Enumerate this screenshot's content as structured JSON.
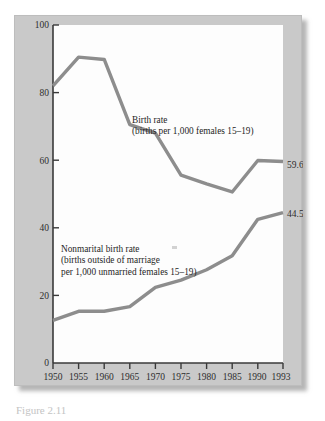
{
  "figure": {
    "caption": "Figure 2.11",
    "panel_color": "#c9c9c9",
    "plot_background": "#fdfdfd",
    "axis_color": "#3a3a3a",
    "series_color": "#8d8d8d"
  },
  "annotations": {
    "birth_rate": {
      "line1": "Birth rate",
      "line2": "(births per 1,000 females 15–19)"
    },
    "nonmarital": {
      "line1": "Nonmarital birth rate",
      "line2": "(births outside of marriage",
      "line3": "per 1,000 unmarried females 15–19)"
    }
  },
  "chart_data": {
    "type": "line",
    "title": "",
    "xlabel": "",
    "ylabel": "",
    "xlim": [
      1950,
      1993
    ],
    "ylim": [
      0,
      100
    ],
    "grid": false,
    "legend": "inline-annotations",
    "x": [
      1950,
      1955,
      1960,
      1965,
      1970,
      1975,
      1980,
      1985,
      1990,
      1993
    ],
    "xtick_labels": [
      "1950",
      "1955",
      "1960",
      "1965",
      "1970",
      "1975",
      "1980",
      "1985",
      "1990",
      "1993"
    ],
    "ytick_labels": [
      "0",
      "20",
      "40",
      "60",
      "80",
      "100"
    ],
    "yticks": [
      0,
      20,
      40,
      60,
      80,
      100
    ],
    "series": [
      {
        "name": "Birth rate",
        "description": "births per 1,000 females 15-19",
        "values": [
          82.0,
          90.5,
          89.8,
          70.5,
          68.0,
          55.6,
          53.0,
          50.6,
          59.9,
          59.6
        ],
        "end_label": "59.6",
        "color": "#8d8d8d"
      },
      {
        "name": "Nonmarital birth rate",
        "description": "births outside of marriage per 1,000 unmarried females 15-19",
        "values": [
          12.6,
          15.3,
          15.3,
          16.7,
          22.4,
          24.5,
          27.6,
          31.7,
          42.5,
          44.5
        ],
        "end_label": "44.5",
        "color": "#8d8d8d"
      }
    ]
  }
}
